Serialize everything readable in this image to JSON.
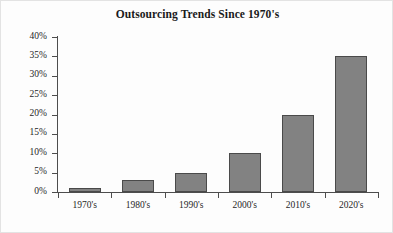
{
  "chart_data": {
    "type": "bar",
    "title": "Outsourcing Trends Since 1970's",
    "xlabel": "",
    "ylabel": "",
    "categories": [
      "1970's",
      "1980's",
      "1990's",
      "2000's",
      "2010's",
      "2020's"
    ],
    "values": [
      1,
      3,
      5,
      10,
      20,
      35
    ],
    "value_suffix": "%",
    "ylim": [
      0,
      40
    ],
    "ytick_values": [
      0,
      5,
      10,
      15,
      20,
      25,
      30,
      35,
      40
    ],
    "ytick_labels": [
      "0%",
      "5%",
      "10%",
      "15%",
      "20%",
      "25%",
      "30%",
      "35%",
      "40%"
    ],
    "grid": false,
    "legend": false,
    "series": [
      {
        "name": "Outsourcing",
        "values": [
          1,
          3,
          5,
          10,
          20,
          35
        ]
      }
    ],
    "colors": {
      "bar_fill": "#828282",
      "bar_border": "#4a4a4a",
      "axis": "#4d4d4d",
      "text": "#1f1f1f",
      "background": "#fdfdfd",
      "frame": "#e3e3e3"
    }
  }
}
